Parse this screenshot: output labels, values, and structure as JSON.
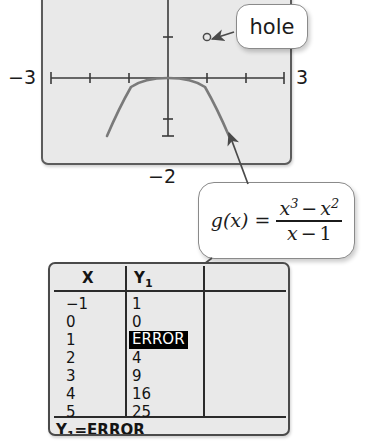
{
  "graph": {
    "axis_labels": {
      "left": "−3",
      "right": "3",
      "bottom": "−2"
    },
    "window": {
      "xmin": -3,
      "xmax": 3,
      "ymin": -2,
      "ymax": 2
    },
    "curve_description": "parabola y = x^2 with a hole at x = 1",
    "hole_point": {
      "x": 1,
      "y": 1
    }
  },
  "callouts": {
    "hole_label": "hole",
    "formula": {
      "lhs": "g(x)",
      "equals": "=",
      "numerator": {
        "term1_base": "x",
        "term1_exp": "3",
        "operator": "−",
        "term2_base": "x",
        "term2_exp": "2"
      },
      "denominator": {
        "term1": "x",
        "operator": "−",
        "term2": "1"
      },
      "plain_text": "g(x) = (x³ − x²)/(x − 1)"
    }
  },
  "calculator": {
    "columns": [
      "X",
      "Y1"
    ],
    "column_header_sub": [
      "",
      "1"
    ],
    "rows": [
      {
        "x": "−1",
        "y1": "1",
        "error": false
      },
      {
        "x": "0",
        "y1": "0",
        "error": false
      },
      {
        "x": "1",
        "y1": "ERROR",
        "error": true
      },
      {
        "x": "2",
        "y1": "4",
        "error": false
      },
      {
        "x": "3",
        "y1": "9",
        "error": false
      },
      {
        "x": "4",
        "y1": "16",
        "error": false
      },
      {
        "x": "5",
        "y1": "25",
        "error": false
      }
    ],
    "status_prefix": "Y",
    "status_sub": "1",
    "status_value": "=ERROR",
    "status_full": "Y1=ERROR"
  },
  "colors": {
    "screen_fill": "#e9e9e9",
    "ink": "#1b1b1b",
    "curve": "#6b6b6b",
    "callout_border": "#8a8a8a",
    "highlight_bg": "#000000",
    "highlight_fg": "#ffffff"
  }
}
